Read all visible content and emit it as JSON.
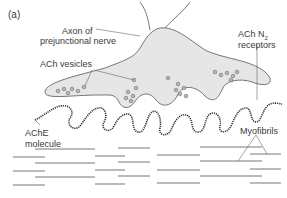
{
  "figure": {
    "panel_label": "(a)",
    "labels": {
      "axon_line1": "Axon of",
      "axon_line2": "prejunctional nerve",
      "vesicles": "ACh vesicles",
      "receptors_line1": "ACh N",
      "receptors_sub": "2",
      "receptors_line2": "receptors",
      "ache_line1": "AChE",
      "ache_line2": "molecule",
      "myofibrils": "Myofibrils"
    },
    "colors": {
      "nerve_fill": "#e6e6e6",
      "outline": "#555555",
      "text": "#3a3a3a",
      "myofibril": "#666666"
    }
  }
}
